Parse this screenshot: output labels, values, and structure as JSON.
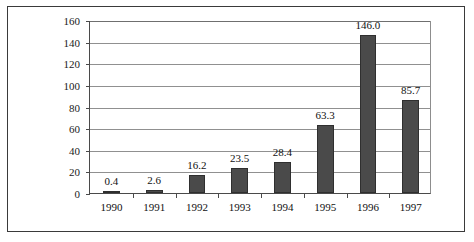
{
  "chart_data": {
    "type": "bar",
    "title": "",
    "subtitle": "",
    "xlabel": "",
    "ylabel": "",
    "categories": [
      "1990",
      "1991",
      "1992",
      "1993",
      "1994",
      "1995",
      "1996",
      "1997"
    ],
    "values": [
      0.4,
      2.6,
      16.2,
      23.5,
      28.4,
      63.3,
      146.0,
      85.7
    ],
    "data_labels": [
      "0.4",
      "2.6",
      "16.2",
      "23.5",
      "28.4",
      "63.3",
      "146.0",
      "85.7"
    ],
    "ylim": [
      0,
      160
    ],
    "ytick_values": [
      0,
      20,
      40,
      60,
      80,
      100,
      120,
      140,
      160
    ],
    "ytick_labels": [
      "0",
      "20",
      "40",
      "60",
      "80",
      "100",
      "120",
      "140",
      "160"
    ],
    "grid": true,
    "grid_axis": "y",
    "legend": false,
    "legend_position": "none",
    "series": [
      {
        "name": "",
        "values": [
          0.4,
          2.6,
          16.2,
          23.5,
          28.4,
          63.3,
          146.0,
          85.7
        ],
        "color": "#4a4a4a"
      }
    ]
  },
  "colors": {
    "bar_fill": "#4a4a4a",
    "bar_stroke": "#2f2f2f",
    "gridline": "#909090",
    "axis": "#4a4a4a",
    "frame": "#3a3a3a",
    "text": "#111111",
    "background": "#ffffff"
  }
}
